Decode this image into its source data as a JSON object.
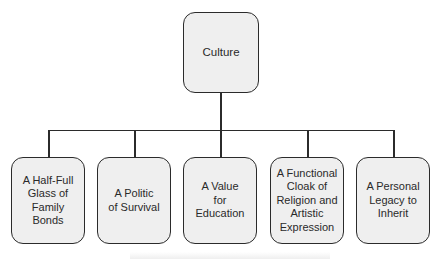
{
  "diagram": {
    "type": "tree",
    "root": {
      "label": "Culture"
    },
    "children": [
      {
        "label": "A Half-Full\nGlass of\nFamily\nBonds"
      },
      {
        "label": "A Politic\nof Survival"
      },
      {
        "label": "A Value\nfor\nEducation"
      },
      {
        "label": "A Functional\nCloak of\nReligion and\nArtistic\nExpression"
      },
      {
        "label": "A Personal\nLegacy to\nInherit"
      }
    ],
    "colors": {
      "node_fill": "#efefef",
      "node_border": "#2b2b2b",
      "connector": "#2b2b2b",
      "text": "#2a2a2a"
    }
  }
}
